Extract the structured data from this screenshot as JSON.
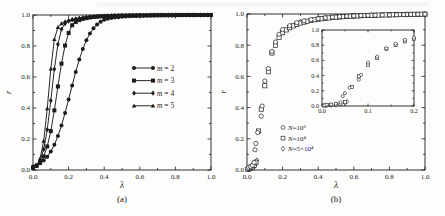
{
  "figure": {
    "ink": "#1c1c1c",
    "background": "#fdfdfb"
  },
  "chart_data": [
    {
      "id": "a",
      "type": "line",
      "caption": "(a)",
      "xlabel": "λ",
      "ylabel": "r",
      "xlim": [
        0,
        1
      ],
      "ylim": [
        0,
        1
      ],
      "xticks": [
        0,
        0.2,
        0.4,
        0.6,
        0.8,
        1
      ],
      "xtick_labels": [
        "0.0",
        "0.2",
        "0.4",
        "0.6",
        "0.8",
        "1.0"
      ],
      "yticks": [
        0,
        0.2,
        0.4,
        0.6,
        0.8,
        1
      ],
      "ytick_labels": [
        "0.0",
        "0.2",
        "0.4",
        "0.6",
        "0.8",
        "1.0"
      ],
      "legend_position": "middle-right",
      "x_step": 0.02,
      "series": [
        {
          "name": "m = 2",
          "marker": "circle",
          "filled": true,
          "line": true,
          "r": [
            0.022,
            0.031,
            0.044,
            0.061,
            0.086,
            0.119,
            0.163,
            0.219,
            0.287,
            0.367,
            0.455,
            0.545,
            0.633,
            0.713,
            0.781,
            0.837,
            0.881,
            0.914,
            0.939,
            0.957,
            0.969,
            0.976,
            0.98,
            0.984,
            0.986,
            0.988,
            0.99,
            0.992,
            0.993,
            0.994,
            0.995,
            0.995,
            0.996,
            0.996,
            0.997,
            0.997,
            0.998,
            0.998,
            0.998,
            0.998,
            0.998,
            0.999,
            0.999,
            0.999,
            0.999,
            0.999,
            0.999,
            0.999,
            1.0,
            1.0,
            1.0
          ]
        },
        {
          "name": "m = 3",
          "marker": "square",
          "filled": true,
          "line": true,
          "r": [
            0.015,
            0.027,
            0.049,
            0.088,
            0.152,
            0.251,
            0.385,
            0.539,
            0.686,
            0.803,
            0.884,
            0.934,
            0.955,
            0.967,
            0.975,
            0.98,
            0.984,
            0.987,
            0.989,
            0.991,
            0.992,
            0.993,
            0.994,
            0.995,
            0.995,
            0.996,
            0.996,
            0.997,
            0.997,
            0.997,
            0.998,
            0.998,
            0.998,
            0.998,
            0.999,
            0.999,
            0.999,
            0.999,
            0.999,
            0.999,
            0.999,
            1.0,
            1.0,
            1.0,
            1.0,
            1.0,
            1.0,
            1.0,
            1.0,
            1.0,
            1.0
          ]
        },
        {
          "name": "m = 4",
          "marker": "diamond",
          "filled": true,
          "line": true,
          "r": [
            0.012,
            0.028,
            0.063,
            0.133,
            0.261,
            0.448,
            0.651,
            0.811,
            0.908,
            0.945,
            0.96,
            0.968,
            0.974,
            0.979,
            0.982,
            0.985,
            0.987,
            0.989,
            0.991,
            0.992,
            0.993,
            0.994,
            0.995,
            0.995,
            0.996,
            0.996,
            0.997,
            0.997,
            0.997,
            0.998,
            0.998,
            0.998,
            0.998,
            0.999,
            0.999,
            0.999,
            0.999,
            0.999,
            0.999,
            0.999,
            0.999,
            1.0,
            1.0,
            1.0,
            1.0,
            1.0,
            1.0,
            1.0,
            1.0,
            1.0,
            1.0
          ]
        },
        {
          "name": "m = 5",
          "marker": "triangle",
          "filled": true,
          "line": true,
          "r": [
            0.01,
            0.027,
            0.074,
            0.186,
            0.396,
            0.653,
            0.843,
            0.92,
            0.945,
            0.958,
            0.966,
            0.972,
            0.977,
            0.981,
            0.984,
            0.986,
            0.988,
            0.99,
            0.991,
            0.992,
            0.993,
            0.994,
            0.995,
            0.996,
            0.996,
            0.997,
            0.997,
            0.997,
            0.998,
            0.998,
            0.998,
            0.998,
            0.999,
            0.999,
            0.999,
            0.999,
            0.999,
            0.999,
            0.999,
            0.999,
            1.0,
            1.0,
            1.0,
            1.0,
            1.0,
            1.0,
            1.0,
            1.0,
            1.0,
            1.0,
            1.0
          ]
        }
      ]
    },
    {
      "id": "b",
      "type": "scatter",
      "caption": "(b)",
      "xlabel": "λ",
      "ylabel": "r",
      "xlim": [
        0,
        1
      ],
      "ylim": [
        0,
        1
      ],
      "xticks": [
        0,
        0.2,
        0.4,
        0.6,
        0.8,
        1
      ],
      "xtick_labels": [
        "0.0",
        "0.2",
        "0.4",
        "0.6",
        "0.8",
        "1.0"
      ],
      "yticks": [
        0,
        0.2,
        0.4,
        0.6,
        0.8,
        1
      ],
      "ytick_labels": [
        "0.0",
        "0.2",
        "0.4",
        "0.6",
        "0.8",
        "1.0"
      ],
      "legend_position": "lower-left",
      "series": [
        {
          "name": "N=10³",
          "marker": "circle",
          "filled": false,
          "line": false,
          "points": [
            [
              0.005,
              0.01
            ],
            [
              0.01,
              0.018
            ],
            [
              0.02,
              0.022
            ],
            [
              0.03,
              0.03
            ],
            [
              0.04,
              0.048
            ],
            [
              0.045,
              0.13
            ],
            [
              0.05,
              0.17
            ],
            [
              0.06,
              0.24
            ],
            [
              0.08,
              0.345
            ],
            [
              0.085,
              0.41
            ],
            [
              0.1,
              0.57
            ],
            [
              0.12,
              0.65
            ],
            [
              0.14,
              0.76
            ],
            [
              0.16,
              0.82
            ],
            [
              0.18,
              0.87
            ],
            [
              0.2,
              0.9
            ],
            [
              0.24,
              0.925
            ],
            [
              0.28,
              0.944
            ],
            [
              0.32,
              0.956
            ],
            [
              0.36,
              0.964
            ],
            [
              0.4,
              0.971
            ],
            [
              0.44,
              0.976
            ],
            [
              0.48,
              0.98
            ],
            [
              0.52,
              0.983
            ],
            [
              0.56,
              0.986
            ],
            [
              0.6,
              0.988
            ],
            [
              0.64,
              0.99
            ],
            [
              0.68,
              0.991
            ],
            [
              0.72,
              0.992
            ],
            [
              0.76,
              0.993
            ],
            [
              0.8,
              0.994
            ],
            [
              0.84,
              0.995
            ],
            [
              0.88,
              0.996
            ],
            [
              0.92,
              0.997
            ],
            [
              0.96,
              0.998
            ],
            [
              1.0,
              0.999
            ]
          ]
        },
        {
          "name": "N=10⁴",
          "marker": "square",
          "filled": false,
          "line": false,
          "points": [
            [
              0.005,
              0.005
            ],
            [
              0.01,
              0.01
            ],
            [
              0.02,
              0.014
            ],
            [
              0.03,
              0.02
            ],
            [
              0.04,
              0.03
            ],
            [
              0.05,
              0.05
            ],
            [
              0.065,
              0.25
            ],
            [
              0.08,
              0.39
            ],
            [
              0.1,
              0.54
            ],
            [
              0.12,
              0.63
            ],
            [
              0.14,
              0.75
            ],
            [
              0.16,
              0.8
            ],
            [
              0.18,
              0.85
            ],
            [
              0.2,
              0.88
            ],
            [
              0.22,
              0.898
            ],
            [
              0.24,
              0.912
            ],
            [
              0.26,
              0.924
            ],
            [
              0.28,
              0.934
            ],
            [
              0.3,
              0.942
            ],
            [
              0.32,
              0.948
            ],
            [
              0.34,
              0.954
            ],
            [
              0.36,
              0.959
            ],
            [
              0.38,
              0.963
            ],
            [
              0.4,
              0.967
            ],
            [
              0.42,
              0.97
            ],
            [
              0.44,
              0.973
            ],
            [
              0.46,
              0.975
            ],
            [
              0.48,
              0.978
            ],
            [
              0.5,
              0.98
            ],
            [
              0.52,
              0.981
            ],
            [
              0.54,
              0.983
            ],
            [
              0.56,
              0.984
            ],
            [
              0.58,
              0.986
            ],
            [
              0.6,
              0.987
            ],
            [
              0.62,
              0.988
            ],
            [
              0.64,
              0.989
            ],
            [
              0.66,
              0.99
            ],
            [
              0.68,
              0.991
            ],
            [
              0.7,
              0.992
            ],
            [
              0.72,
              0.992
            ],
            [
              0.74,
              0.993
            ],
            [
              0.76,
              0.994
            ],
            [
              0.78,
              0.994
            ],
            [
              0.8,
              0.995
            ],
            [
              0.82,
              0.995
            ],
            [
              0.84,
              0.996
            ],
            [
              0.86,
              0.996
            ],
            [
              0.88,
              0.997
            ],
            [
              0.9,
              0.997
            ],
            [
              0.92,
              0.998
            ],
            [
              0.94,
              0.998
            ],
            [
              0.96,
              0.998
            ],
            [
              0.98,
              0.999
            ],
            [
              1.0,
              0.999
            ]
          ]
        },
        {
          "name": "N=5×10⁴",
          "marker": "diamond",
          "filled": false,
          "line": false,
          "points": [
            [
              0.01,
              0.004
            ],
            [
              0.02,
              0.008
            ],
            [
              0.03,
              0.014
            ],
            [
              0.04,
              0.022
            ],
            [
              0.05,
              0.04
            ],
            [
              0.055,
              0.06
            ],
            [
              0.2,
              0.895
            ],
            [
              0.3,
              0.948
            ],
            [
              0.4,
              0.97
            ],
            [
              0.5,
              0.981
            ],
            [
              0.6,
              0.988
            ],
            [
              0.7,
              0.992
            ],
            [
              0.8,
              0.995
            ],
            [
              0.9,
              0.997
            ],
            [
              1.0,
              0.999
            ]
          ]
        }
      ],
      "inset": {
        "xlim": [
          0,
          0.2
        ],
        "ylim": [
          0,
          1
        ],
        "xticks": [
          0,
          0.1,
          0.2
        ],
        "xtick_labels": [
          "0.0",
          "0.1",
          "0.2"
        ],
        "yticks": [
          0,
          0.2,
          0.4,
          0.6,
          0.8,
          1
        ],
        "ytick_labels": [
          "0.0",
          "0.2",
          "0.4",
          "0.6",
          "0.8",
          "1.0"
        ]
      }
    }
  ]
}
